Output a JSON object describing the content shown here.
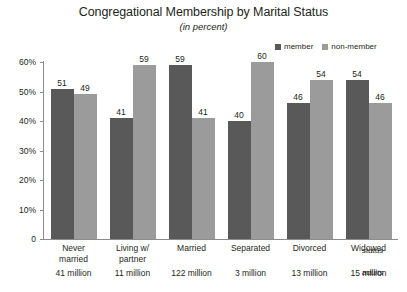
{
  "chart_data": {
    "type": "bar",
    "title": "Congregational Membership by Marital Status",
    "subtitle": "(in percent)",
    "xlabel": "status",
    "ylabel": "",
    "ylim": [
      0,
      60
    ],
    "grid": true,
    "legend_position": "top-right",
    "categories": [
      "Never married",
      "Living w/ partner",
      "Married",
      "Separated",
      "Divorced",
      "Widowed"
    ],
    "category_lines": [
      [
        "Never",
        "married"
      ],
      [
        "Living w/",
        "partner"
      ],
      [
        "Married",
        ""
      ],
      [
        "Separated",
        ""
      ],
      [
        "Divorced",
        ""
      ],
      [
        "Widowed",
        ""
      ]
    ],
    "category_counts": [
      "41 million",
      "11 million",
      "122 million",
      "3 million",
      "13 million",
      "15 million"
    ],
    "count_axis_label": "adults",
    "series": [
      {
        "name": "member",
        "color": "#595959",
        "values": [
          51,
          41,
          59,
          40,
          46,
          54
        ]
      },
      {
        "name": "non-member",
        "color": "#9b9b9b",
        "values": [
          49,
          59,
          41,
          60,
          54,
          46
        ]
      }
    ],
    "yticks": [
      0,
      10,
      20,
      30,
      40,
      50,
      60
    ],
    "ytick_labels": [
      "0",
      "10%",
      "20%",
      "30%",
      "40%",
      "50%",
      "60%"
    ]
  },
  "colors": {
    "axis": "#8c8c8c",
    "gridline": "#ffffff",
    "text": "#231f20",
    "background": "#ffffff"
  }
}
